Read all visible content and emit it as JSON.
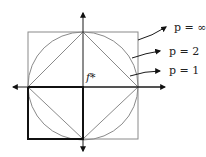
{
  "diagram": {
    "center_label": "f*",
    "labels": [
      {
        "text": "p = ∞",
        "shape": "square"
      },
      {
        "text": "p = 2",
        "shape": "circle"
      },
      {
        "text": "p = 1",
        "shape": "diamond"
      }
    ],
    "colors": {
      "shape_stroke": "#8a8a8a",
      "axis": "#1a1a1a",
      "bold": "#111111"
    }
  }
}
